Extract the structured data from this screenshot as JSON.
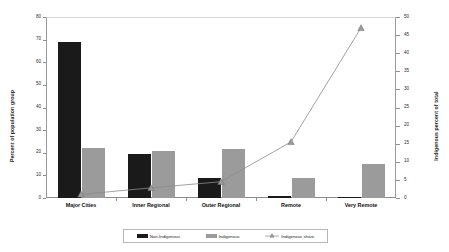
{
  "chart_data": {
    "type": "bar",
    "title": "",
    "subtitle": "",
    "xlabel": "",
    "ylabel": "Percent of population group",
    "y2label": "Indigenous percent of total",
    "categories": [
      "Major Cities",
      "Inner Regional",
      "Outer Regional",
      "Remote",
      "Very Remote"
    ],
    "series": [
      {
        "name": "Non-Indigenous",
        "type": "bar",
        "axis": "left",
        "color": "#1a1a1a",
        "values": [
          69,
          19.5,
          9,
          1,
          0.3
        ]
      },
      {
        "name": "Indigenous",
        "type": "bar",
        "axis": "left",
        "color": "#9b9b9b",
        "values": [
          22,
          21,
          21.5,
          9,
          15
        ]
      },
      {
        "name": "Indigenous share",
        "type": "line",
        "axis": "right",
        "color": "#8a8a8a",
        "marker": "triangle",
        "values": [
          1.0,
          2.8,
          4.5,
          15.5,
          47
        ]
      }
    ],
    "ylim": [
      0,
      80
    ],
    "yticks": [
      0,
      10,
      20,
      30,
      40,
      50,
      60,
      70,
      80
    ],
    "y2lim": [
      0,
      50
    ],
    "y2ticks": [
      0,
      5,
      10,
      15,
      20,
      25,
      30,
      35,
      40,
      45,
      50
    ],
    "grid": false,
    "legend_position": "bottom"
  },
  "axes": {
    "left": {
      "title": "Percent of population group",
      "ticks": [
        "80",
        "70",
        "60",
        "50",
        "40",
        "30",
        "20",
        "10",
        "0"
      ]
    },
    "right": {
      "title": "Indigenous percent of total",
      "ticks": [
        "50",
        "45",
        "40",
        "35",
        "30",
        "25",
        "20",
        "15",
        "10",
        "5",
        "0"
      ]
    }
  },
  "legend": {
    "items": [
      {
        "label": "Non-Indigenous",
        "marker": "filled-square-black"
      },
      {
        "label": "Indigenous",
        "marker": "filled-square-gray"
      },
      {
        "label": "Indigenous share",
        "marker": "line-triangle-gray"
      }
    ]
  },
  "colors": {
    "non_indigenous": "#1a1a1a",
    "indigenous": "#9b9b9b",
    "line": "#8a8a8a",
    "axis": "#8f8f8f",
    "background": "#ffffff"
  }
}
